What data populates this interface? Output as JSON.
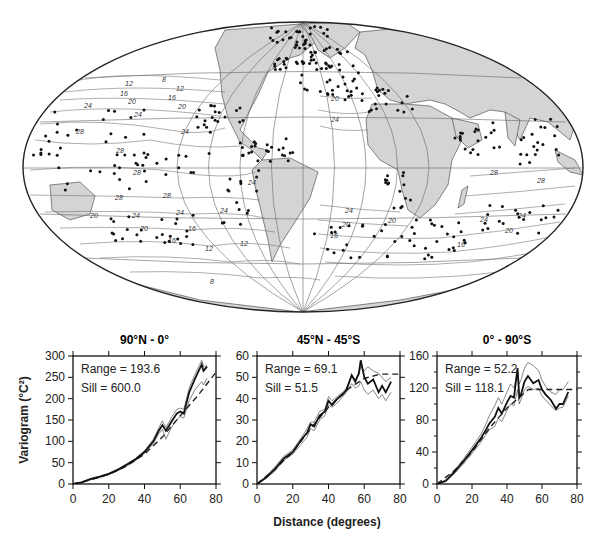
{
  "figure": {
    "map": {
      "projection": "Mollweide-like world map centered on Atlantic",
      "land_color": "#d4d4d4",
      "ocean_color": "#ffffff",
      "contour_labels": [
        {
          "text": "12",
          "x": 125,
          "y": 86
        },
        {
          "text": "16",
          "x": 120,
          "y": 96
        },
        {
          "text": "8",
          "x": 162,
          "y": 82
        },
        {
          "text": "12",
          "x": 176,
          "y": 91
        },
        {
          "text": "16",
          "x": 168,
          "y": 100
        },
        {
          "text": "20",
          "x": 128,
          "y": 104
        },
        {
          "text": "20",
          "x": 178,
          "y": 109
        },
        {
          "text": "24",
          "x": 84,
          "y": 108
        },
        {
          "text": "24",
          "x": 134,
          "y": 117
        },
        {
          "text": "24",
          "x": 181,
          "y": 134
        },
        {
          "text": "28",
          "x": 76,
          "y": 134
        },
        {
          "text": "28",
          "x": 116,
          "y": 153
        },
        {
          "text": "28",
          "x": 133,
          "y": 175
        },
        {
          "text": "28",
          "x": 115,
          "y": 200
        },
        {
          "text": "28",
          "x": 163,
          "y": 198
        },
        {
          "text": "24",
          "x": 248,
          "y": 185
        },
        {
          "text": "24",
          "x": 132,
          "y": 218
        },
        {
          "text": "24",
          "x": 176,
          "y": 215
        },
        {
          "text": "24",
          "x": 220,
          "y": 213
        },
        {
          "text": "20",
          "x": 90,
          "y": 218
        },
        {
          "text": "20",
          "x": 140,
          "y": 231
        },
        {
          "text": "16",
          "x": 188,
          "y": 231
        },
        {
          "text": "16",
          "x": 168,
          "y": 243
        },
        {
          "text": "12",
          "x": 205,
          "y": 251
        },
        {
          "text": "12",
          "x": 240,
          "y": 246
        },
        {
          "text": "8",
          "x": 210,
          "y": 284
        },
        {
          "text": "20",
          "x": 331,
          "y": 101
        },
        {
          "text": "24",
          "x": 331,
          "y": 122
        },
        {
          "text": "24",
          "x": 345,
          "y": 213
        },
        {
          "text": "20",
          "x": 342,
          "y": 227
        },
        {
          "text": "16",
          "x": 330,
          "y": 238
        },
        {
          "text": "20",
          "x": 388,
          "y": 223
        },
        {
          "text": "24",
          "x": 480,
          "y": 222
        },
        {
          "text": "28",
          "x": 537,
          "y": 183
        },
        {
          "text": "24",
          "x": 518,
          "y": 218
        },
        {
          "text": "20",
          "x": 505,
          "y": 233
        },
        {
          "text": "16",
          "x": 457,
          "y": 247
        },
        {
          "text": "28",
          "x": 490,
          "y": 175
        }
      ]
    },
    "x_axis_title": "Distance (degrees)",
    "y_axis_title": "Variogram (°C²)"
  },
  "chart_data": [
    {
      "type": "line",
      "title": "90°N - 0°",
      "xlabel": "Distance (degrees)",
      "ylabel": "Variogram (°C²)",
      "xlim": [
        0,
        80
      ],
      "ylim": [
        0,
        300
      ],
      "xticks": [
        0,
        20,
        40,
        60,
        80
      ],
      "yticks": [
        0,
        50,
        100,
        150,
        200,
        250,
        300
      ],
      "annotations": [
        "Range = 193.6",
        "Sill = 600.0"
      ],
      "range": 193.6,
      "sill": 600.0,
      "x": [
        0,
        5,
        10,
        15,
        20,
        25,
        30,
        35,
        40,
        45,
        48,
        50,
        52,
        55,
        58,
        60,
        62,
        65,
        68,
        70,
        72,
        73,
        75
      ],
      "series": [
        {
          "name": "empirical",
          "style": "thick solid",
          "values": [
            0,
            4,
            12,
            17,
            24,
            33,
            45,
            58,
            75,
            100,
            125,
            138,
            125,
            145,
            165,
            170,
            165,
            215,
            245,
            262,
            280,
            265,
            275
          ]
        },
        {
          "name": "upper bound",
          "style": "thin solid",
          "values": [
            0,
            5,
            13,
            18,
            25,
            35,
            47,
            60,
            78,
            105,
            132,
            148,
            132,
            155,
            175,
            178,
            175,
            225,
            255,
            272,
            290,
            275,
            278
          ]
        },
        {
          "name": "lower bound",
          "style": "thin solid",
          "values": [
            0,
            3,
            10,
            15,
            22,
            31,
            42,
            55,
            72,
            95,
            118,
            128,
            105,
            132,
            150,
            158,
            155,
            195,
            220,
            230,
            240,
            232,
            248
          ]
        },
        {
          "name": "fitted model",
          "style": "dashed",
          "x": [
            0,
            10,
            20,
            30,
            40,
            50,
            60,
            70,
            80
          ],
          "values": [
            0,
            10,
            23,
            42,
            70,
            110,
            160,
            208,
            262
          ]
        }
      ]
    },
    {
      "type": "line",
      "title": "45°N - 45°S",
      "xlabel": "Distance (degrees)",
      "ylabel": "",
      "xlim": [
        0,
        80
      ],
      "ylim": [
        0,
        60
      ],
      "xticks": [
        0,
        20,
        40,
        60,
        80
      ],
      "yticks": [
        0,
        10,
        20,
        30,
        40,
        50,
        60
      ],
      "annotations": [
        "Range = 69.1",
        "Sill = 51.5"
      ],
      "range": 69.1,
      "sill": 51.5,
      "x": [
        0,
        5,
        10,
        15,
        20,
        25,
        28,
        30,
        32,
        35,
        38,
        40,
        42,
        45,
        48,
        50,
        53,
        55,
        57,
        58,
        60,
        62,
        65,
        68,
        70,
        72,
        75
      ],
      "series": [
        {
          "name": "empirical",
          "style": "thick solid",
          "values": [
            0,
            3,
            7,
            12,
            15,
            21,
            24,
            28,
            27,
            32,
            34,
            39,
            37,
            40,
            42,
            44,
            51,
            48,
            52,
            58,
            50,
            47,
            49,
            43,
            46,
            43,
            48
          ]
        },
        {
          "name": "upper bound",
          "style": "thin solid",
          "values": [
            0,
            3.5,
            8,
            13,
            16,
            22,
            26,
            29,
            29,
            34,
            35,
            41,
            39,
            41,
            43,
            45,
            51,
            49,
            51,
            55,
            53,
            55,
            53,
            52,
            50,
            48,
            50
          ]
        },
        {
          "name": "lower bound",
          "style": "thin solid",
          "values": [
            0,
            2.5,
            6,
            11,
            14,
            19,
            22,
            26,
            25,
            30,
            32,
            37,
            36,
            38,
            41,
            43,
            47,
            45,
            46,
            48,
            44,
            42,
            44,
            40,
            42,
            39,
            43
          ]
        },
        {
          "name": "fitted model",
          "style": "dashed",
          "x": [
            0,
            10,
            20,
            30,
            40,
            50,
            60,
            69.1,
            80
          ],
          "values": [
            0,
            7,
            15,
            26,
            36,
            44,
            49.5,
            51.5,
            51.5
          ]
        }
      ]
    },
    {
      "type": "line",
      "title": "0° - 90°S",
      "xlabel": "Distance (degrees)",
      "ylabel": "",
      "xlim": [
        0,
        80
      ],
      "ylim": [
        0,
        160
      ],
      "xticks": [
        0,
        20,
        40,
        60,
        80
      ],
      "yticks": [
        0,
        40,
        80,
        120,
        160
      ],
      "annotations": [
        "Range = 52.2",
        "Sill = 118.1"
      ],
      "range": 52.2,
      "sill": 118.1,
      "x": [
        0,
        5,
        10,
        15,
        20,
        25,
        28,
        30,
        33,
        35,
        37,
        40,
        42,
        44,
        46,
        47,
        48,
        50,
        52,
        55,
        58,
        60,
        62,
        65,
        68,
        70,
        72,
        75
      ],
      "series": [
        {
          "name": "empirical",
          "style": "thick solid",
          "values": [
            0,
            4,
            15,
            28,
            42,
            57,
            68,
            76,
            84,
            95,
            88,
            102,
            110,
            108,
            145,
            108,
            112,
            128,
            135,
            126,
            130,
            118,
            112,
            105,
            94,
            100,
            100,
            115
          ]
        },
        {
          "name": "upper bound",
          "style": "thin solid",
          "values": [
            0,
            5,
            17,
            31,
            46,
            62,
            75,
            86,
            98,
            108,
            100,
            115,
            125,
            120,
            140,
            125,
            130,
            145,
            152,
            148,
            142,
            130,
            122,
            115,
            112,
            118,
            118,
            128
          ]
        },
        {
          "name": "lower bound",
          "style": "thin solid",
          "values": [
            0,
            3,
            13,
            25,
            38,
            52,
            62,
            68,
            72,
            82,
            78,
            92,
            100,
            98,
            118,
            100,
            106,
            118,
            122,
            118,
            120,
            110,
            105,
            98,
            92,
            95,
            96,
            110
          ]
        },
        {
          "name": "fitted model",
          "style": "dashed",
          "x": [
            0,
            10,
            20,
            30,
            40,
            52.2,
            60,
            70,
            80
          ],
          "values": [
            0,
            17,
            40,
            70,
            95,
            118.1,
            118.1,
            118.1,
            118.1
          ]
        }
      ]
    }
  ]
}
